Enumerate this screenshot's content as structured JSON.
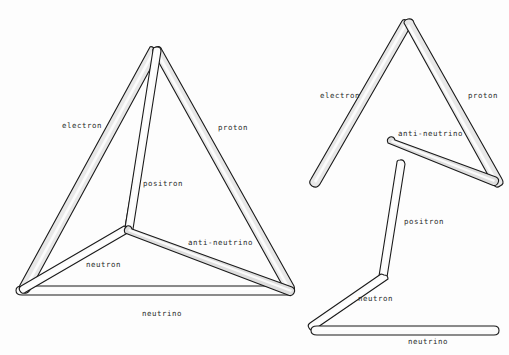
{
  "figure": {
    "background_color": "#fdfdfd",
    "rod_fill_color": "#e8e8e8",
    "rod_outline_color": "#1a1a1a"
  },
  "left_figure": {
    "name": "assembled-tetrahedron",
    "labels": {
      "electron": "electron",
      "proton": "proton",
      "positron": "positron",
      "neutron": "neutron",
      "anti_neutrino": "anti-neutrino",
      "neutrino": "neutrino"
    },
    "vertices": {
      "apex": [
        157,
        50
      ],
      "bottom_left": [
        21,
        292
      ],
      "bottom_right": [
        289,
        292
      ],
      "center_junction": [
        127,
        230
      ]
    }
  },
  "right_top_figure": {
    "name": "exploded-upper-group",
    "labels": {
      "electron": "electron",
      "proton": "proton",
      "anti_neutrino": "anti-neutrino"
    },
    "vertices": {
      "apex": [
        408,
        22
      ],
      "electron_end": [
        313,
        184
      ],
      "proton_end": [
        497,
        183
      ],
      "anti_neutrino_start": [
        390,
        139
      ],
      "anti_neutrino_end": [
        494,
        181
      ]
    }
  },
  "right_bottom_figure": {
    "name": "exploded-lower-group",
    "labels": {
      "positron": "positron",
      "neutron": "neutron",
      "neutrino": "neutrino"
    },
    "vertices": {
      "positron_top": [
        402,
        162
      ],
      "positron_bottom": [
        382,
        277
      ],
      "neutron_end": [
        312,
        327
      ],
      "neutrino_left": [
        312,
        331
      ],
      "neutrino_right": [
        496,
        331
      ]
    }
  },
  "labels_flat": [
    {
      "id": "left-electron",
      "text": "electron",
      "x": 62,
      "y": 122
    },
    {
      "id": "left-proton",
      "text": "proton",
      "x": 218,
      "y": 124
    },
    {
      "id": "left-positron",
      "text": "positron",
      "x": 143,
      "y": 180
    },
    {
      "id": "left-anti-neutrino",
      "text": "anti-neutrino",
      "x": 188,
      "y": 239
    },
    {
      "id": "left-neutron",
      "text": "neutron",
      "x": 86,
      "y": 261
    },
    {
      "id": "left-neutrino",
      "text": "neutrino",
      "x": 142,
      "y": 310
    },
    {
      "id": "right-electron",
      "text": "electron",
      "x": 320,
      "y": 92
    },
    {
      "id": "right-proton",
      "text": "proton",
      "x": 468,
      "y": 92
    },
    {
      "id": "right-anti-neutrino",
      "text": "anti-neutrino",
      "x": 398,
      "y": 130
    },
    {
      "id": "right-positron",
      "text": "positron",
      "x": 404,
      "y": 218
    },
    {
      "id": "right-neutron",
      "text": "neutron",
      "x": 358,
      "y": 295
    },
    {
      "id": "right-neutrino",
      "text": "neutrino",
      "x": 408,
      "y": 338
    }
  ]
}
